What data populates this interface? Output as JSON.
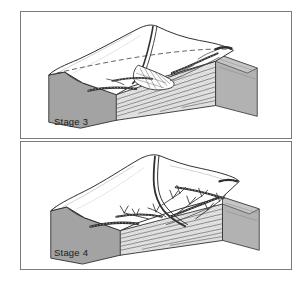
{
  "figure": {
    "type": "geologic-block-diagram-pair",
    "background_color": "#ffffff",
    "frame_color": "#7b7b7b"
  },
  "panels": [
    {
      "id": "stage3",
      "caption": "Stage 3",
      "description": "Block diagram of an uplifted sedimentary plateau dissected by a single main stream that has cut a canyon and deposited an alluvial fan at its mouth",
      "features": {
        "upland_surface": "broad dipping plateau surface",
        "drainage": "one main trunk stream with short tributaries",
        "depositional_landform": "alluvial fan",
        "strata": "horizontal stippled sedimentary layers",
        "layer_count": 9
      },
      "colors": {
        "top_surface": "#ffffff",
        "left_escarpment": "#a3a3a3",
        "right_face": "#b5b5b5",
        "strata_fill": "#e8e8e8",
        "outline": "#2b2b2b"
      }
    },
    {
      "id": "stage4",
      "caption": "Stage 4",
      "description": "Block diagram of a more advanced erosion stage showing a widened valley and a branching dendritic tributary network extending into the upland",
      "features": {
        "upland_surface": "reduced remnant plateau",
        "drainage": "dendritic tributary network with many branches",
        "depositional_landform": "widened valley floor",
        "strata": "horizontal stippled sedimentary layers",
        "layer_count": 9
      },
      "colors": {
        "top_surface": "#ffffff",
        "left_escarpment": "#a3a3a3",
        "right_face": "#b5b5b5",
        "strata_fill": "#e8e8e8",
        "outline": "#2b2b2b"
      }
    }
  ]
}
